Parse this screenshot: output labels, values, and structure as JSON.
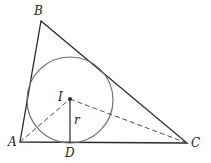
{
  "diagram": {
    "colors": {
      "triangle": "#2a2a2a",
      "circle": "#6e6e6e",
      "dashed": "#3a3a3a",
      "radius": "#2a2a2a",
      "label": "#222222"
    },
    "vertices": {
      "A": {
        "label": "A",
        "x": 20,
        "y": 142
      },
      "B": {
        "label": "B",
        "x": 41,
        "y": 21
      },
      "C": {
        "label": "C",
        "x": 187,
        "y": 143
      }
    },
    "incenter": {
      "label": "I",
      "x": 70,
      "y": 99
    },
    "tangent_point": {
      "label": "D",
      "x": 70,
      "y": 143
    },
    "radius_label": "r",
    "circle": {
      "cx": 70,
      "cy": 100,
      "r": 43
    },
    "labels": {
      "A": "A",
      "B": "B",
      "C": "C",
      "D": "D",
      "I": "I",
      "r": "r"
    }
  }
}
